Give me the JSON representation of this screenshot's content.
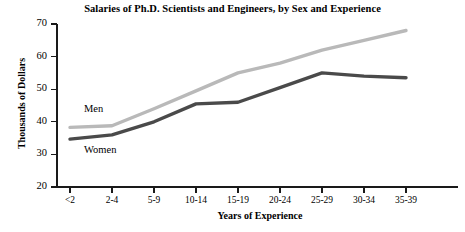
{
  "chart_data": {
    "type": "line",
    "title": "Salaries of Ph.D. Scientists and Engineers, by Sex and Experience",
    "xlabel": "Years of Experience",
    "ylabel": "Thousands of Dollars",
    "categories": [
      "<2",
      "2-4",
      "5-9",
      "10-14",
      "15-19",
      "20-24",
      "25-29",
      "30-34",
      "35-39"
    ],
    "ylim": [
      20,
      70
    ],
    "yticks": [
      20,
      30,
      40,
      50,
      60,
      70
    ],
    "grid": false,
    "legend_position": "inline-annotations",
    "series": [
      {
        "name": "Men",
        "color": "#b9b9b9",
        "values": [
          38.3,
          38.8,
          44.0,
          49.5,
          55.0,
          58.0,
          62.0,
          65.0,
          68.0
        ]
      },
      {
        "name": "Women",
        "color": "#4a4a4a",
        "values": [
          34.7,
          36.0,
          40.0,
          45.5,
          46.0,
          50.5,
          55.0,
          54.0,
          53.5
        ]
      }
    ],
    "annotations": [
      {
        "text": "Men",
        "series": "Men"
      },
      {
        "text": "Women",
        "series": "Women"
      }
    ],
    "axis_color": "#1a1a1a"
  }
}
